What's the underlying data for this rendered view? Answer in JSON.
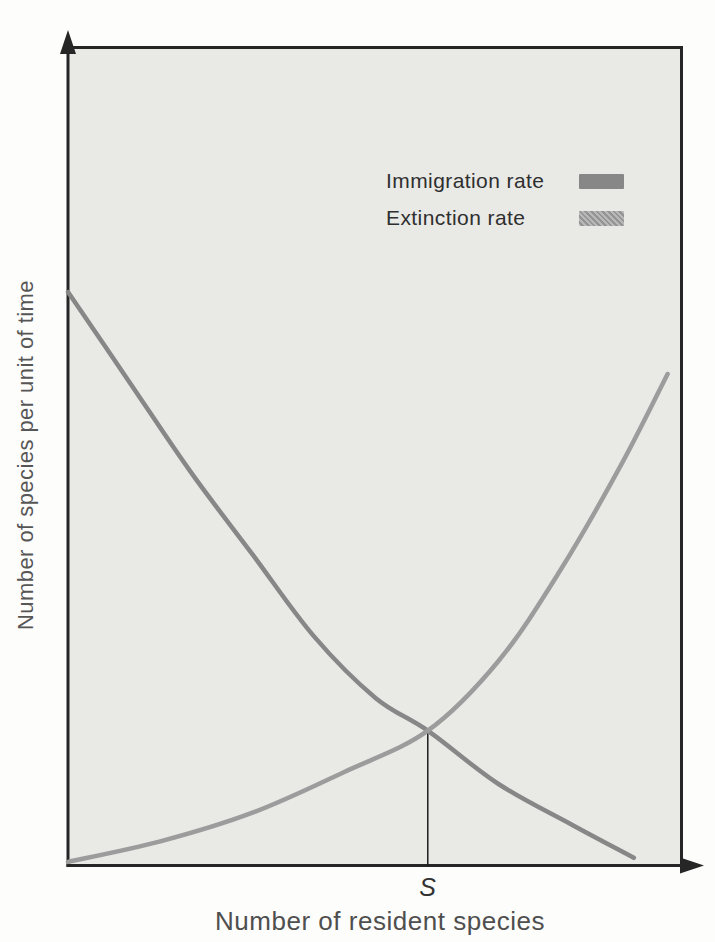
{
  "figure": {
    "x_axis_label": "Number of resident species",
    "y_axis_label": "Number of species per unit of time"
  },
  "colors": {
    "panel_background": "#e9e9e6",
    "axis": "#262626",
    "equilibrium_line": "#1d1d1d",
    "immigration_curve": "#878787",
    "extinction_curve": "#9c9c9c"
  },
  "chart_data": {
    "type": "line",
    "title": "",
    "xlabel": "Number of resident species",
    "ylabel": "Number of species per unit of time",
    "x_range": [
      0,
      1
    ],
    "y_range": [
      0,
      1
    ],
    "grid": false,
    "axes_quantitative": false,
    "legend_position": "top-right-inside",
    "series": [
      {
        "name": "Immigration rate",
        "color": "#878787",
        "shape": "concave decreasing (exponential decay)",
        "points": [
          [
            0,
            0.7
          ],
          [
            0.1,
            0.59
          ],
          [
            0.2,
            0.48
          ],
          [
            0.3,
            0.38
          ],
          [
            0.4,
            0.28
          ],
          [
            0.5,
            0.205
          ],
          [
            0.585,
            0.165
          ],
          [
            0.7,
            0.1
          ],
          [
            0.82,
            0.05
          ],
          [
            0.92,
            0.01
          ]
        ]
      },
      {
        "name": "Extinction rate",
        "color": "#9c9c9c",
        "shape": "convex increasing (exponential growth)",
        "points": [
          [
            0,
            0.005
          ],
          [
            0.15,
            0.03
          ],
          [
            0.3,
            0.065
          ],
          [
            0.45,
            0.115
          ],
          [
            0.585,
            0.165
          ],
          [
            0.7,
            0.25
          ],
          [
            0.8,
            0.36
          ],
          [
            0.9,
            0.49
          ],
          [
            0.975,
            0.6
          ]
        ]
      }
    ],
    "equilibrium": {
      "x": 0.585,
      "y": 0.165,
      "label": "S",
      "marker": "thin vertical line from curve intersection down to x-axis"
    }
  }
}
